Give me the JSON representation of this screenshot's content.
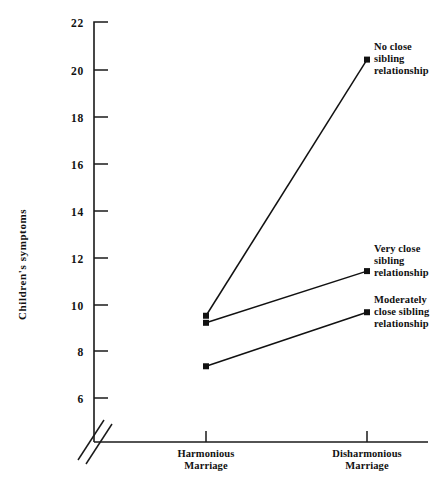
{
  "chart_data": {
    "type": "line",
    "title": "",
    "xlabel": "",
    "ylabel": "Children's symptoms",
    "categories": [
      "Harmonious Marriage",
      "Disharmonious Marriage"
    ],
    "category_lines": [
      [
        "Harmonious",
        "Marriage"
      ],
      [
        "Disharmonious",
        "Marriage"
      ]
    ],
    "ylim": [
      5,
      22
    ],
    "yticks": [
      6,
      8,
      10,
      12,
      14,
      16,
      18,
      20,
      22
    ],
    "ytick_labels": [
      "6",
      "8",
      "10",
      "12",
      "14",
      "16",
      "18",
      "20",
      "22"
    ],
    "y_axis_break": true,
    "grid": false,
    "legend_position": "inline-right",
    "marker": "square",
    "series": [
      {
        "name": "No close sibling relationship",
        "label_lines": [
          "No close",
          "sibling",
          "relationship"
        ],
        "values": [
          9.5,
          20.4
        ]
      },
      {
        "name": "Very close sibling relationship",
        "label_lines": [
          "Very close",
          "sibling",
          "relationship"
        ],
        "values": [
          9.2,
          11.4
        ]
      },
      {
        "name": "Moderately close sibling relationship",
        "label_lines": [
          "Moderately",
          "close sibling",
          "relationship"
        ],
        "values": [
          7.35,
          9.65
        ]
      }
    ],
    "colors": {
      "line": "#111111",
      "axis": "#1a1a1a",
      "text": "#111111",
      "background": "#ffffff"
    }
  },
  "axis": {
    "y_label": "Children's symptoms",
    "ytick_0": "6",
    "ytick_1": "8",
    "ytick_2": "10",
    "ytick_3": "12",
    "ytick_4": "14",
    "ytick_5": "16",
    "ytick_6": "18",
    "ytick_7": "20",
    "ytick_8": "22",
    "xcat_0_line0": "Harmonious",
    "xcat_0_line1": "Marriage",
    "xcat_1_line0": "Disharmonious",
    "xcat_1_line1": "Marriage"
  },
  "annotations": {
    "s0_line0": "No close",
    "s0_line1": "sibling",
    "s0_line2": "relationship",
    "s1_line0": "Very close",
    "s1_line1": "sibling",
    "s1_line2": "relationship",
    "s2_line0": "Moderately",
    "s2_line1": "close sibling",
    "s2_line2": "relationship"
  }
}
